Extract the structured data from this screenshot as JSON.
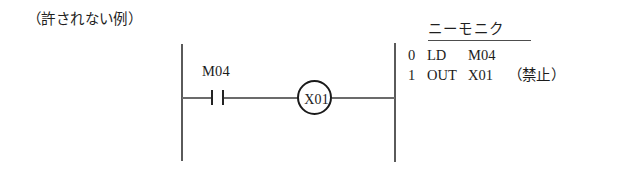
{
  "caption": "（許されない例）",
  "ladder": {
    "contact": {
      "label": "M04",
      "type": "normally-open-contact"
    },
    "coil": {
      "label": "X01",
      "type": "output-coil"
    }
  },
  "mnemonic": {
    "title": "ニーモニク",
    "rows": [
      {
        "step": "0",
        "instruction": "LD",
        "operand": "M04",
        "note": ""
      },
      {
        "step": "1",
        "instruction": "OUT",
        "operand": "X01",
        "note": "（禁止）"
      }
    ]
  },
  "colors": {
    "ink": "#1c1c1c",
    "rail": "#5a5a5a",
    "rung": "#6b6b6b",
    "background": "#ffffff"
  }
}
